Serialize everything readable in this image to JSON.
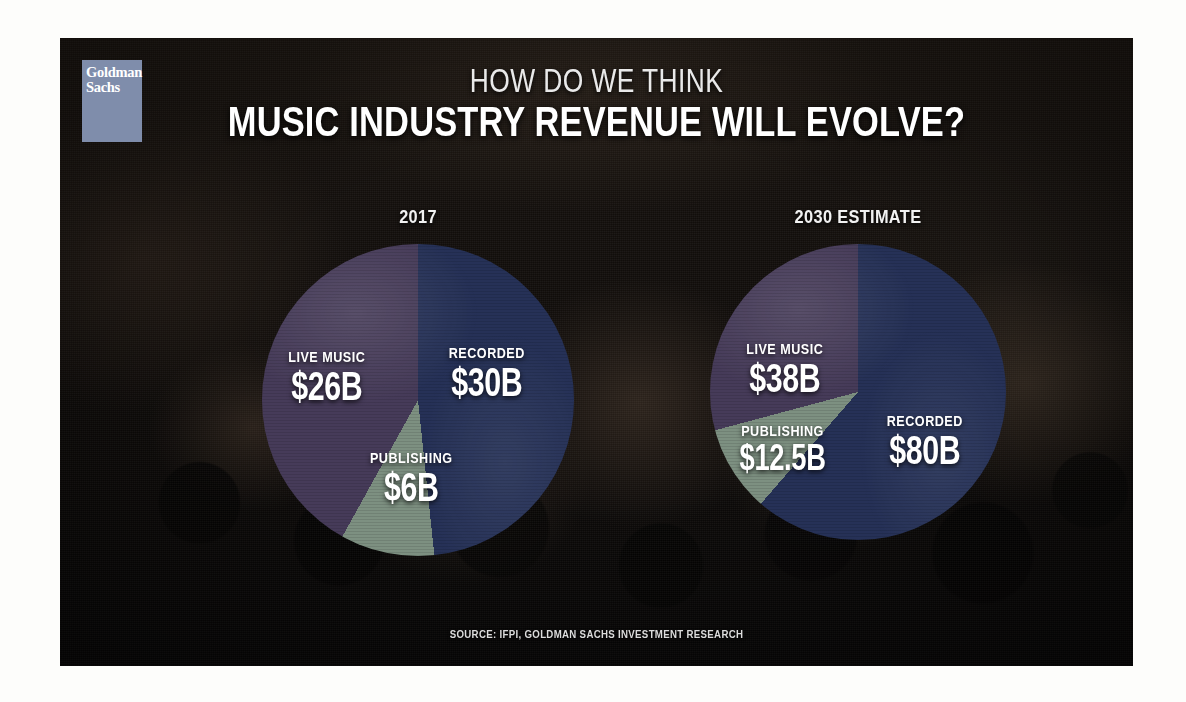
{
  "brand": {
    "logo_line1": "Goldman",
    "logo_line2": "Sachs",
    "logo_color": "#7f8cab"
  },
  "headline": {
    "kicker": "HOW DO WE THINK",
    "main": "MUSIC INDUSTRY REVENUE WILL EVOLVE?"
  },
  "source": {
    "text": "SOURCE: IFPI, GOLDMAN SACHS INVESTMENT RESEARCH"
  },
  "palette": {
    "recorded": "#24315c",
    "live_music": "#473a5c",
    "publishing": "#7b9180",
    "background": "#0d0a08",
    "text": "#ffffff"
  },
  "chart_data": [
    {
      "type": "pie",
      "title": "2017",
      "unit": "USD billions",
      "total": 62,
      "categories": [
        "Recorded",
        "Live Music",
        "Publishing"
      ],
      "values": [
        30,
        26,
        6
      ],
      "labels": [
        "$30B",
        "$26B",
        "$6B"
      ],
      "colors": [
        "#24315c",
        "#473a5c",
        "#7b9180"
      ],
      "slices": [
        {
          "name": "RECORDED",
          "value": 30,
          "label": "$30B",
          "color": "#24315c",
          "percent": 48.4,
          "start_deg": 0,
          "sweep_deg": 174
        },
        {
          "name": "PUBLISHING",
          "value": 6,
          "label": "$6B",
          "color": "#7b9180",
          "percent": 9.7,
          "start_deg": 174,
          "sweep_deg": 35
        },
        {
          "name": "LIVE MUSIC",
          "value": 26,
          "label": "$26B",
          "color": "#473a5c",
          "percent": 41.9,
          "start_deg": 209,
          "sweep_deg": 151
        }
      ],
      "legend": "on-slice",
      "grid": false
    },
    {
      "type": "pie",
      "title": "2030 ESTIMATE",
      "unit": "USD billions",
      "total": 130.5,
      "categories": [
        "Recorded",
        "Live Music",
        "Publishing"
      ],
      "values": [
        80,
        38,
        12.5
      ],
      "labels": [
        "$80B",
        "$38B",
        "$12.5B"
      ],
      "colors": [
        "#24315c",
        "#473a5c",
        "#7b9180"
      ],
      "slices": [
        {
          "name": "RECORDED",
          "value": 80,
          "label": "$80B",
          "color": "#24315c",
          "percent": 61.3,
          "start_deg": 0,
          "sweep_deg": 221
        },
        {
          "name": "PUBLISHING",
          "value": 12.5,
          "label": "$12.5B",
          "color": "#7b9180",
          "percent": 9.6,
          "start_deg": 221,
          "sweep_deg": 34
        },
        {
          "name": "LIVE MUSIC",
          "value": 38,
          "label": "$38B",
          "color": "#473a5c",
          "percent": 29.1,
          "start_deg": 255,
          "sweep_deg": 105
        }
      ],
      "legend": "on-slice",
      "grid": false
    }
  ]
}
